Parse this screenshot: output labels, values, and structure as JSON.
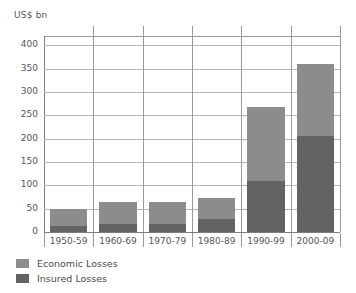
{
  "chart_data": {
    "type": "bar",
    "subtype": "stacked",
    "title": "",
    "subtitle": "",
    "xlabel": "",
    "ylabel": "US$ bn",
    "unit_caption": "US$ bn",
    "categories": [
      "1950-59",
      "1960-69",
      "1970-79",
      "1980-89",
      "1990-99",
      "2000-09"
    ],
    "series": [
      {
        "name": "Economic Losses",
        "color": "#8c8c8c",
        "values": [
          50,
          65,
          64,
          72,
          268,
          360
        ]
      },
      {
        "name": "Insured Losses",
        "color": "#636363",
        "values": [
          12,
          18,
          18,
          27,
          110,
          205
        ]
      }
    ],
    "stack_note": "Economic Losses is the total bar height; Insured Losses is the dark lower portion of each bar.",
    "ylim": [
      0,
      420
    ],
    "ytick_values": [
      0,
      50,
      100,
      150,
      200,
      250,
      300,
      350,
      400
    ],
    "ytick_labels": [
      "0",
      "50",
      "100",
      "150",
      "200",
      "250",
      "300",
      "350",
      "400"
    ],
    "grid": true,
    "grid_axis": "y",
    "legend_position": "bottom-left",
    "legend": [
      "Economic Losses",
      "Insured Losses"
    ]
  },
  "legend": {
    "items": [
      {
        "label": "Economic Losses",
        "color": "#8c8c8c"
      },
      {
        "label": "Insured Losses",
        "color": "#636363"
      }
    ]
  },
  "colors": {
    "economic": "#8c8c8c",
    "insured": "#636363",
    "grid": "#b5b5b5",
    "axis": "#7d7d7d",
    "text": "#555555",
    "background": "#ffffff"
  }
}
